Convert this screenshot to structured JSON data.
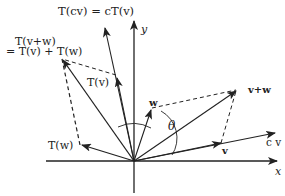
{
  "diagram": {
    "axes": {
      "x_label": "x",
      "y_label": "y"
    },
    "labels": {
      "tcv": "T(cv) = cT(v)",
      "tvw_line1": "T(v+w)",
      "tvw_line2": "= T(v) + T(w)",
      "tv": "T(v)",
      "tw": "T(w)",
      "w": "w",
      "vw": "v+w",
      "v": "v",
      "cv": "c v",
      "theta": "θ"
    },
    "colors": {
      "stroke": "#222222",
      "background": "#ffffff"
    }
  }
}
